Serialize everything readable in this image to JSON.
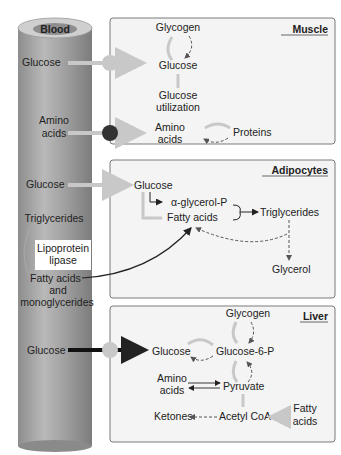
{
  "vessel": {
    "label": "Blood"
  },
  "blood_labels": {
    "glucose_muscle": "Glucose",
    "amino_l1": "Amino",
    "amino_l2": "acids",
    "glucose_adipo": "Glucose",
    "triglycerides": "Triglycerides",
    "lpl_l1": "Lipoprotein",
    "lpl_l2": "lipase",
    "fa_l1": "Fatty acids",
    "fa_l2": "and",
    "fa_l3": "monoglycerides",
    "glucose_liver": "Glucose"
  },
  "muscle": {
    "title": "Muscle",
    "glycogen": "Glycogen",
    "glucose": "Glucose",
    "util_l1": "Glucose",
    "util_l2": "utilization",
    "amino_l1": "Amino",
    "amino_l2": "acids",
    "proteins": "Proteins"
  },
  "adipocytes": {
    "title": "Adipocytes",
    "glucose": "Glucose",
    "agp": "α-glycerol-P",
    "fatty_acids": "Fatty acids",
    "triglycerides": "Triglycerides",
    "glycerol": "Glycerol"
  },
  "liver": {
    "title": "Liver",
    "glycogen": "Glycogen",
    "glucose": "Glucose",
    "g6p": "Glucose-6-P",
    "amino_l1": "Amino",
    "amino_l2": "acids",
    "pyruvate": "Pyruvate",
    "ketones": "Ketones",
    "acetyl": "Acetyl CoA",
    "fa_l1": "Fatty",
    "fa_l2": "acids"
  },
  "colors": {
    "panel_bg": "#f4f4f4",
    "panel_border": "#7a7a7a",
    "light_arrow": "#c8c8c8",
    "dark_node": "#333333",
    "liver_arrow": "#111111"
  }
}
